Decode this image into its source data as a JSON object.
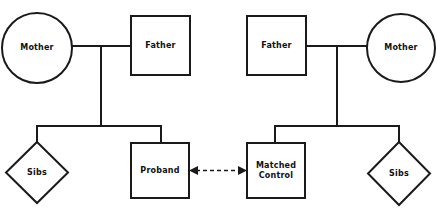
{
  "diagram": {
    "colors": {
      "background": "#ffffff",
      "stroke": "#1a1a1a",
      "shape_fill": "#ffffff",
      "text": "#111111"
    },
    "families": [
      {
        "id": "proband-family",
        "side": "left",
        "nodes": [
          {
            "id": "left-mother",
            "label": "Mother",
            "shape": "circle"
          },
          {
            "id": "left-father",
            "label": "Father",
            "shape": "square"
          },
          {
            "id": "left-sibs",
            "label": "Sibs",
            "shape": "diamond"
          },
          {
            "id": "left-proband",
            "label": "Proband",
            "shape": "square"
          }
        ]
      },
      {
        "id": "control-family",
        "side": "right",
        "nodes": [
          {
            "id": "right-father",
            "label": "Father",
            "shape": "square"
          },
          {
            "id": "right-mother",
            "label": "Mother",
            "shape": "circle"
          },
          {
            "id": "right-control",
            "label": "Matched\nControl",
            "shape": "square"
          },
          {
            "id": "right-sibs",
            "label": "Sibs",
            "shape": "diamond"
          }
        ]
      }
    ],
    "link": {
      "id": "proband-control-link",
      "style": "dashed",
      "arrowheads": "both",
      "from": "left-proband",
      "to": "right-control",
      "label": ""
    }
  }
}
